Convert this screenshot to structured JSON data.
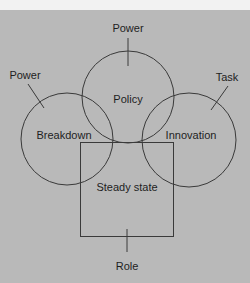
{
  "diagram": {
    "colors": {
      "background": "#b9b9b9",
      "top_strip": "#f2f2f2",
      "stroke": "#3a3a3a",
      "text": "#1e1e1e"
    },
    "shapes": {
      "policy_circle": {
        "label": "Policy",
        "cx": 128,
        "cy": 97,
        "r": 46
      },
      "breakdown_circle": {
        "label": "Breakdown",
        "cx": 67,
        "cy": 139,
        "r": 46
      },
      "innovation_circle": {
        "label": "Innovation",
        "cx": 189,
        "cy": 140,
        "r": 47
      },
      "steady_state_box": {
        "label": "Steady state",
        "x": 80,
        "y": 142,
        "width": 93,
        "height": 94
      }
    },
    "callouts": {
      "top": {
        "label": "Power"
      },
      "left": {
        "label": "Power"
      },
      "right": {
        "label": "Task"
      },
      "bottom": {
        "label": "Role"
      }
    }
  }
}
